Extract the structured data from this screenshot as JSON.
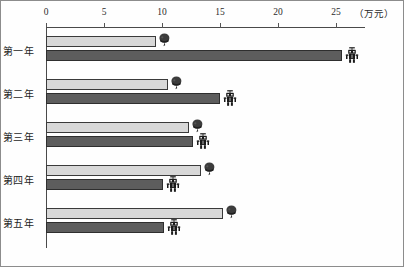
{
  "chart_data": {
    "type": "bar",
    "orientation": "horizontal",
    "title": "",
    "subtitle": "",
    "xlabel": "",
    "ylabel": "",
    "unit_label": "（万元）",
    "xlim": [
      0,
      27.5
    ],
    "grid": false,
    "legend_position": "none",
    "axis_position": "top",
    "categories": [
      "第一年",
      "第二年",
      "第三年",
      "第四年",
      "第五年"
    ],
    "tick_labels": [
      "0",
      "5",
      "10",
      "15",
      "20",
      "25"
    ],
    "tick_values": [
      0,
      5,
      10,
      15,
      20,
      25
    ],
    "series": [
      {
        "name": "light-series",
        "color": "#d8d8d8",
        "marker": "head-icon",
        "values": [
          9.5,
          10.5,
          12.3,
          13.4,
          15.3
        ]
      },
      {
        "name": "dark-series",
        "color": "#5d5d5d",
        "marker": "robot-icon",
        "values": [
          25.5,
          15.0,
          12.7,
          10.1,
          10.2
        ]
      }
    ],
    "annotations": []
  },
  "colors": {
    "light_bar": "#d8d8d8",
    "light_bar_border": "#3a3a3a",
    "dark_bar": "#5d5d5d",
    "dark_bar_border": "#2e2e2e",
    "axis": "#4a4a4a",
    "text": "#1d1d1d",
    "frame": "#8c8c8c"
  },
  "geometry": {
    "origin_x": 45,
    "px_per_unit": 11.6,
    "axis_top": 26
  }
}
